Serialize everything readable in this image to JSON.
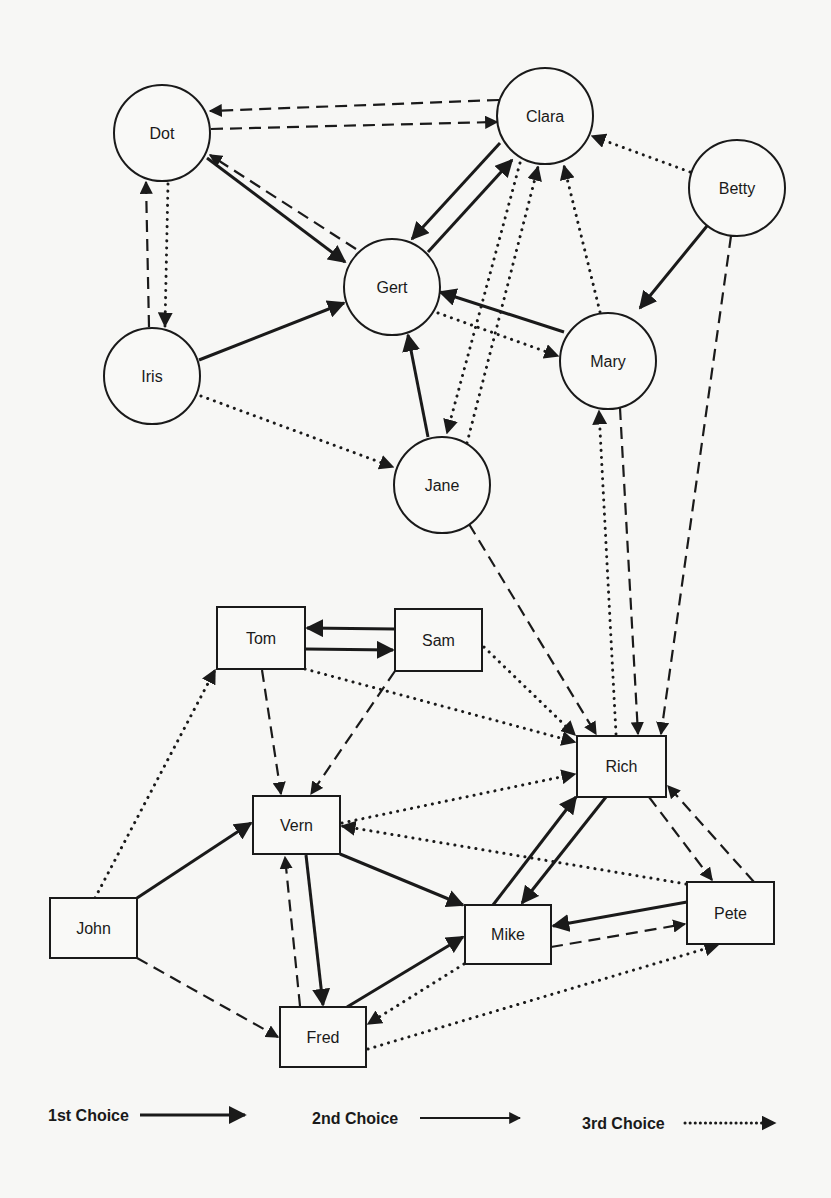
{
  "diagram": {
    "type": "sociogram",
    "colors": {
      "ink": "#1a1a1a",
      "background": "#f7f7f5",
      "node_fill": "#f9f9f7"
    },
    "nodes": [
      {
        "id": "Dot",
        "label": "Dot",
        "shape": "circle",
        "cx": 162,
        "cy": 133,
        "r": 48
      },
      {
        "id": "Clara",
        "label": "Clara",
        "shape": "circle",
        "cx": 545,
        "cy": 116,
        "r": 48
      },
      {
        "id": "Betty",
        "label": "Betty",
        "shape": "circle",
        "cx": 737,
        "cy": 188,
        "r": 48
      },
      {
        "id": "Gert",
        "label": "Gert",
        "shape": "circle",
        "cx": 392,
        "cy": 287,
        "r": 48
      },
      {
        "id": "Iris",
        "label": "Iris",
        "shape": "circle",
        "cx": 152,
        "cy": 376,
        "r": 48
      },
      {
        "id": "Mary",
        "label": "Mary",
        "shape": "circle",
        "cx": 608,
        "cy": 361,
        "r": 48
      },
      {
        "id": "Jane",
        "label": "Jane",
        "shape": "circle",
        "cx": 442,
        "cy": 485,
        "r": 48
      },
      {
        "id": "Tom",
        "label": "Tom",
        "shape": "box",
        "x": 217,
        "y": 607,
        "w": 88,
        "h": 62
      },
      {
        "id": "Sam",
        "label": "Sam",
        "shape": "box",
        "x": 395,
        "y": 609,
        "w": 87,
        "h": 62
      },
      {
        "id": "Rich",
        "label": "Rich",
        "shape": "box",
        "x": 577,
        "y": 736,
        "w": 89,
        "h": 61
      },
      {
        "id": "Vern",
        "label": "Vern",
        "shape": "box",
        "x": 253,
        "y": 796,
        "w": 87,
        "h": 58
      },
      {
        "id": "John",
        "label": "John",
        "shape": "box",
        "x": 50,
        "y": 898,
        "w": 87,
        "h": 60
      },
      {
        "id": "Mike",
        "label": "Mike",
        "shape": "box",
        "x": 465,
        "y": 905,
        "w": 86,
        "h": 59
      },
      {
        "id": "Pete",
        "label": "Pete",
        "shape": "box",
        "x": 687,
        "y": 882,
        "w": 87,
        "h": 62
      },
      {
        "id": "Fred",
        "label": "Fred",
        "shape": "box",
        "x": 280,
        "y": 1007,
        "w": 86,
        "h": 60
      }
    ],
    "edges": [
      {
        "from": "Dot",
        "to": "Gert",
        "choice": 1,
        "pts": [
          207,
          158,
          345,
          262
        ]
      },
      {
        "from": "Clara",
        "to": "Gert",
        "choice": 1,
        "pts": [
          500,
          143,
          412,
          239
        ]
      },
      {
        "from": "Gert",
        "to": "Clara",
        "choice": 1,
        "pts": [
          428,
          252,
          512,
          160
        ]
      },
      {
        "from": "Iris",
        "to": "Gert",
        "choice": 1,
        "pts": [
          199,
          360,
          344,
          303
        ]
      },
      {
        "from": "Jane",
        "to": "Gert",
        "choice": 1,
        "pts": [
          428,
          437,
          408,
          335
        ]
      },
      {
        "from": "Mary",
        "to": "Gert",
        "choice": 1,
        "pts": [
          564,
          332,
          440,
          292
        ]
      },
      {
        "from": "Betty",
        "to": "Mary",
        "choice": 1,
        "pts": [
          707,
          226,
          640,
          308
        ]
      },
      {
        "from": "Tom",
        "to": "Sam",
        "choice": 1,
        "pts": [
          305,
          649,
          393,
          650
        ]
      },
      {
        "from": "Sam",
        "to": "Tom",
        "choice": 1,
        "pts": [
          395,
          629,
          307,
          628
        ]
      },
      {
        "from": "John",
        "to": "Vern",
        "choice": 1,
        "pts": [
          137,
          898,
          251,
          823
        ]
      },
      {
        "from": "Vern",
        "to": "Fred",
        "choice": 1,
        "pts": [
          306,
          855,
          323,
          1005
        ]
      },
      {
        "from": "Vern",
        "to": "Mike",
        "choice": 1,
        "pts": [
          340,
          854,
          463,
          905
        ]
      },
      {
        "from": "Fred",
        "to": "Mike",
        "choice": 1,
        "pts": [
          347,
          1007,
          463,
          937
        ]
      },
      {
        "from": "Mike",
        "to": "Rich",
        "choice": 1,
        "pts": [
          493,
          905,
          576,
          797
        ]
      },
      {
        "from": "Rich",
        "to": "Mike",
        "choice": 1,
        "pts": [
          606,
          797,
          522,
          903
        ]
      },
      {
        "from": "Pete",
        "to": "Mike",
        "choice": 1,
        "pts": [
          687,
          902,
          553,
          926
        ]
      },
      {
        "from": "Clara",
        "to": "Dot",
        "choice": 2,
        "pts": [
          499,
          100,
          210,
          111
        ]
      },
      {
        "from": "Dot",
        "to": "Clara",
        "choice": 2,
        "pts": [
          211,
          129,
          497,
          122
        ]
      },
      {
        "from": "Gert",
        "to": "Dot",
        "choice": 2,
        "pts": [
          356,
          249,
          210,
          155
        ]
      },
      {
        "from": "Iris",
        "to": "Dot",
        "choice": 2,
        "pts": [
          149,
          327,
          146,
          182
        ]
      },
      {
        "from": "Jane",
        "to": "Rich",
        "choice": 2,
        "pts": [
          469,
          524,
          596,
          734
        ]
      },
      {
        "from": "Mary",
        "to": "Rich",
        "choice": 2,
        "pts": [
          620,
          408,
          638,
          734
        ]
      },
      {
        "from": "Betty",
        "to": "Rich",
        "choice": 2,
        "pts": [
          731,
          236,
          661,
          734
        ]
      },
      {
        "from": "Tom",
        "to": "Vern",
        "choice": 2,
        "pts": [
          262,
          670,
          281,
          794
        ]
      },
      {
        "from": "Sam",
        "to": "Vern",
        "choice": 2,
        "pts": [
          395,
          671,
          311,
          794
        ]
      },
      {
        "from": "John",
        "to": "Fred",
        "choice": 2,
        "pts": [
          137,
          958,
          278,
          1037
        ]
      },
      {
        "from": "Fred",
        "to": "Vern",
        "choice": 2,
        "pts": [
          300,
          1006,
          285,
          857
        ]
      },
      {
        "from": "Rich",
        "to": "Pete",
        "choice": 2,
        "pts": [
          649,
          797,
          712,
          880
        ]
      },
      {
        "from": "Pete",
        "to": "Rich",
        "choice": 2,
        "pts": [
          754,
          882,
          668,
          786
        ]
      },
      {
        "from": "Mike",
        "to": "Pete",
        "choice": 2,
        "pts": [
          551,
          947,
          685,
          924
        ]
      },
      {
        "from": "Dot",
        "to": "Iris",
        "choice": 3,
        "pts": [
          168,
          184,
          165,
          326
        ]
      },
      {
        "from": "Betty",
        "to": "Clara",
        "choice": 3,
        "pts": [
          690,
          172,
          592,
          136
        ]
      },
      {
        "from": "Mary",
        "to": "Clara",
        "choice": 3,
        "pts": [
          600,
          312,
          564,
          166
        ]
      },
      {
        "from": "Jane",
        "to": "Clara",
        "choice": 3,
        "pts": [
          467,
          443,
          538,
          167
        ]
      },
      {
        "from": "Clara",
        "to": "Jane",
        "choice": 3,
        "pts": [
          520,
          163,
          447,
          433
        ]
      },
      {
        "from": "Gert",
        "to": "Mary",
        "choice": 3,
        "pts": [
          438,
          313,
          558,
          356
        ]
      },
      {
        "from": "Iris",
        "to": "Jane",
        "choice": 3,
        "pts": [
          201,
          396,
          393,
          467
        ]
      },
      {
        "from": "Rich",
        "to": "Mary",
        "choice": 3,
        "pts": [
          616,
          734,
          599,
          411
        ]
      },
      {
        "from": "John",
        "to": "Tom",
        "choice": 3,
        "pts": [
          95,
          898,
          215,
          670
        ]
      },
      {
        "from": "Tom",
        "to": "Rich",
        "choice": 3,
        "pts": [
          305,
          669,
          575,
          742
        ]
      },
      {
        "from": "Sam",
        "to": "Rich",
        "choice": 3,
        "pts": [
          484,
          647,
          575,
          735
        ]
      },
      {
        "from": "Vern",
        "to": "Rich",
        "choice": 3,
        "pts": [
          342,
          823,
          575,
          774
        ]
      },
      {
        "from": "Pete",
        "to": "Vern",
        "choice": 3,
        "pts": [
          686,
          884,
          342,
          826
        ]
      },
      {
        "from": "Mike",
        "to": "Fred",
        "choice": 3,
        "pts": [
          464,
          964,
          368,
          1024
        ]
      },
      {
        "from": "Fred",
        "to": "Pete",
        "choice": 3,
        "pts": [
          368,
          1049,
          718,
          945
        ]
      }
    ]
  },
  "legend": {
    "items": [
      {
        "label": "1st Choice",
        "style": "solid-thick",
        "label_x": 48,
        "line_x1": 88,
        "line_x2": 157,
        "y": 1115
      },
      {
        "label": "2nd Choice",
        "style": "solid-thin",
        "label_x": 312,
        "line_x1": 260,
        "line_x2": 327,
        "y": 1118
      },
      {
        "label": "3rd Choice",
        "style": "dotted",
        "label_x": 580,
        "line_x1": 428,
        "line_x2": 480,
        "y": 1123
      }
    ]
  }
}
